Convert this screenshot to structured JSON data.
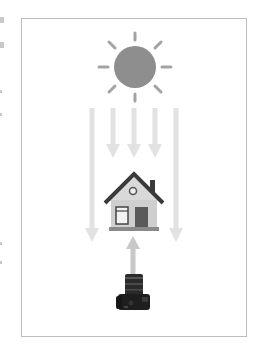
{
  "diagram": {
    "title": "",
    "elements": {
      "sun": {
        "label": "sun-icon",
        "color": "#8e8e8e"
      },
      "incoming_light_arrows": {
        "count": 5,
        "color": "#e2e2e2",
        "direction": "down"
      },
      "house": {
        "label": "house-icon",
        "roof_color": "#3a3a3a",
        "wall_color": "#d9d9d9",
        "door_color": "#5a5a5a"
      },
      "reflected_arrow": {
        "direction": "up",
        "color": "#c8c8c8"
      },
      "camera": {
        "label": "camera-icon",
        "color": "#1e1e1e"
      }
    },
    "frame_color": "#bdbdbd"
  }
}
